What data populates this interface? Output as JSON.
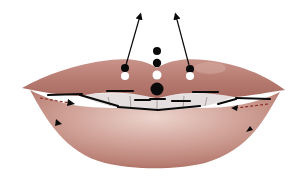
{
  "figure": {
    "colors": {
      "background": "#ffffff",
      "upper_lip": "#b77c72",
      "upper_lip_highlight": "#d0a097",
      "lower_lip": "#c79187",
      "lower_lip_highlight": "#ecd4cd",
      "lower_lip_edge": "#a8655a",
      "teeth": "#e4dede",
      "marker_black": "#0a0a0a",
      "marker_white": "#ffffff",
      "dashed_line": "#8a2a22"
    },
    "markers": {
      "center_dots": [
        {
          "x": 157,
          "y": 51,
          "r": 4,
          "fill": "black"
        },
        {
          "x": 157,
          "y": 63,
          "r": 4.2,
          "fill": "black"
        },
        {
          "x": 157,
          "y": 75,
          "r": 4.5,
          "fill": "white"
        },
        {
          "x": 157,
          "y": 89,
          "r": 6.5,
          "fill": "black"
        }
      ],
      "peak_dots": [
        {
          "side": "left",
          "black": {
            "x": 125,
            "y": 68
          },
          "white": {
            "x": 125,
            "y": 76
          }
        },
        {
          "side": "right",
          "black": {
            "x": 190,
            "y": 69
          },
          "white": {
            "x": 190,
            "y": 76
          }
        }
      ],
      "arrows_up": [
        {
          "side": "left",
          "from": [
            126,
            65
          ],
          "to": [
            141,
            14
          ]
        },
        {
          "side": "right",
          "from": [
            189,
            65
          ],
          "to": [
            175,
            14
          ]
        }
      ]
    }
  }
}
